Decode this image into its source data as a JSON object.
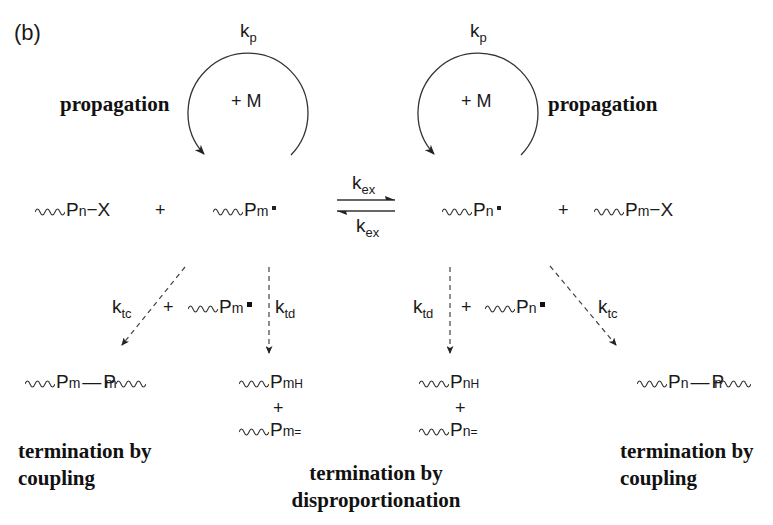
{
  "panel_label": "(b)",
  "propagation": {
    "label": "propagation",
    "rate_constant": "k",
    "rate_subscript": "p",
    "reagent": "+ M"
  },
  "exchange": {
    "rate_constant": "k",
    "rate_subscript": "ex"
  },
  "reactants_left": [
    {
      "symbol": "P",
      "subscript": "n",
      "suffix": "−X"
    },
    {
      "symbol": "P",
      "subscript": "m",
      "suffix": "radical-dot"
    }
  ],
  "reactants_right": [
    {
      "symbol": "P",
      "subscript": "n",
      "suffix": "radical-dot"
    },
    {
      "symbol": "P",
      "subscript": "m",
      "suffix": "−X"
    }
  ],
  "plus": "+",
  "termination": {
    "coupling_rate": {
      "k": "k",
      "sub": "tc"
    },
    "disproportionation_rate": {
      "k": "k",
      "sub": "td"
    },
    "left_reagent": {
      "symbol": "P",
      "subscript": "m"
    },
    "right_reagent": {
      "symbol": "P",
      "subscript": "n"
    },
    "left_coupling_product": {
      "a": "P",
      "a_sub": "m",
      "bond": "—",
      "b": "P",
      "b_sub": "m"
    },
    "right_coupling_product": {
      "a": "P",
      "a_sub": "n",
      "bond": "—",
      "b": "P",
      "b_sub": "n"
    },
    "left_disp_products": [
      {
        "symbol": "P",
        "subscript": "m",
        "superscript": "H"
      },
      {
        "symbol": "P",
        "subscript": "m",
        "superscript": "="
      }
    ],
    "right_disp_products": [
      {
        "symbol": "P",
        "subscript": "n",
        "superscript": "H"
      },
      {
        "symbol": "P",
        "subscript": "n",
        "superscript": "="
      }
    ],
    "coupling_label_line1": "termination by",
    "coupling_label_line2": "coupling",
    "disp_label_line1": "termination by",
    "disp_label_line2": "disproportionation"
  }
}
